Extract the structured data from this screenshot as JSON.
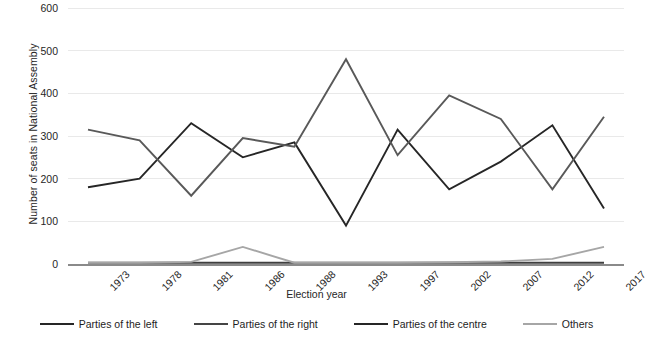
{
  "chart_data": {
    "type": "line",
    "title": "",
    "xlabel": "Election year",
    "ylabel": "Number of seats in National Assembly",
    "categories": [
      "1973",
      "1978",
      "1981",
      "1986",
      "1988",
      "1993",
      "1997",
      "2002",
      "2007",
      "2012",
      "2017"
    ],
    "ylim": [
      0,
      600
    ],
    "yticks": [
      0,
      100,
      200,
      300,
      400,
      500,
      600
    ],
    "grid": true,
    "legend_position": "bottom",
    "series": [
      {
        "name": "Parties of the left",
        "color": "#262626",
        "values": [
          180,
          200,
          330,
          250,
          285,
          90,
          315,
          175,
          240,
          325,
          130
        ]
      },
      {
        "name": "Parties of the right",
        "color": "#595959",
        "values": [
          315,
          290,
          160,
          295,
          275,
          480,
          255,
          395,
          340,
          175,
          345
        ]
      },
      {
        "name": "Parties of the centre",
        "color": "#3f3f3f",
        "values": [
          3,
          3,
          3,
          3,
          3,
          3,
          3,
          3,
          3,
          3,
          3
        ]
      },
      {
        "name": "Others",
        "color": "#a6a6a6",
        "values": [
          3,
          3,
          5,
          40,
          3,
          3,
          3,
          4,
          6,
          12,
          40
        ]
      }
    ]
  },
  "axis": {
    "yticks": [
      "600",
      "500",
      "400",
      "300",
      "200",
      "100",
      "0"
    ],
    "ylabel": "Number of seats in National Assembly",
    "xlabel": "Election year",
    "xticks": [
      "1973",
      "1978",
      "1981",
      "1986",
      "1988",
      "1993",
      "1997",
      "2002",
      "2007",
      "2012",
      "2017"
    ]
  },
  "legend": {
    "items": [
      {
        "label": "Parties of the left",
        "color": "#262626"
      },
      {
        "label": "Parties of the right",
        "color": "#454545"
      },
      {
        "label": "Parties of the centre",
        "color": "#262626"
      },
      {
        "label": "Others",
        "color": "#a6a6a6"
      }
    ]
  }
}
